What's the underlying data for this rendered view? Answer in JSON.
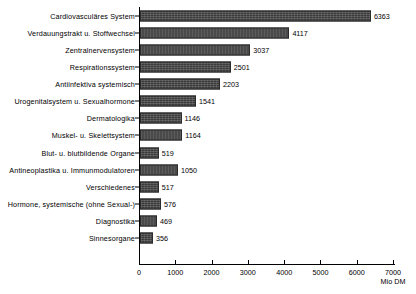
{
  "chart_data": {
    "type": "bar",
    "orientation": "horizontal",
    "title": "",
    "xlabel": "Mio DM",
    "ylabel": "",
    "xlim": [
      0,
      7000
    ],
    "grid": false,
    "legend": null,
    "xticks": [
      0,
      1000,
      2000,
      3000,
      4000,
      5000,
      6000,
      7000
    ],
    "xtick_labels": [
      "0",
      "1000",
      "2000",
      "3000",
      "4000",
      "5000",
      "6000",
      "7000"
    ],
    "categories": [
      "Cardiovasculäres System",
      "Verdauungstrakt u. Stoffwechsel",
      "Zentralnervensystem",
      "Respirationssystem",
      "Antiinfektiva systemisch",
      "Urogenitalsystem u. Sexualhormone",
      "Dermatologika",
      "Muskel- u. Skelettsystem",
      "Blut- u. blutbildende Organe",
      "Antineoplastika u. Immunmodulatoren",
      "Verschiedenes",
      "Hormone, systemische (ohne Sexual-)",
      "Diagnostika",
      "Sinnesorgane"
    ],
    "values": [
      6363,
      4117,
      3037,
      2501,
      2203,
      1541,
      1146,
      1164,
      519,
      1050,
      517,
      576,
      469,
      356
    ],
    "value_labels": [
      "6363",
      "4117",
      "3037",
      "2501",
      "2203",
      "1541",
      "1146",
      "1164",
      "519",
      "1050",
      "517",
      "576",
      "469",
      "356"
    ],
    "bar_color": "#3a3a3a",
    "axis_color": "#000000"
  }
}
